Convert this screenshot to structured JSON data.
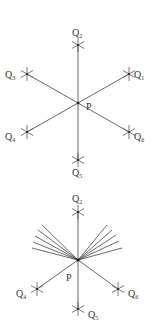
{
  "diagrams": [
    {
      "name": "six-direction-star",
      "center": {
        "label": "P",
        "x": 78,
        "y": 103,
        "label_x": 86,
        "label_y": 110
      },
      "points": [
        {
          "label": "Q",
          "sub": "1",
          "x": 129,
          "y": 74,
          "lx": 134,
          "ly": 78
        },
        {
          "label": "Q",
          "sub": "2",
          "x": 78,
          "y": 45,
          "lx": 72,
          "ly": 36
        },
        {
          "label": "Q",
          "sub": "3",
          "x": 27,
          "y": 74,
          "lx": 5,
          "ly": 78
        },
        {
          "label": "Q",
          "sub": "4",
          "x": 27,
          "y": 132,
          "lx": 5,
          "ly": 140
        },
        {
          "label": "Q",
          "sub": "5",
          "x": 78,
          "y": 160,
          "lx": 72,
          "ly": 176
        },
        {
          "label": "Q",
          "sub": "6",
          "x": 129,
          "y": 132,
          "lx": 134,
          "ly": 140
        }
      ]
    },
    {
      "name": "fan-diagram",
      "center": {
        "label": "P",
        "x": 78,
        "y": 260,
        "label_x": 66,
        "label_y": 281
      },
      "points": [
        {
          "label": "Q",
          "sub": "2",
          "x": 78,
          "y": 212,
          "lx": 72,
          "ly": 202
        },
        {
          "label": "Q",
          "sub": "4",
          "x": 37,
          "y": 289,
          "lx": 16,
          "ly": 297
        },
        {
          "label": "Q",
          "sub": "5",
          "x": 78,
          "y": 309,
          "lx": 88,
          "ly": 318
        },
        {
          "label": "Q",
          "sub": "6",
          "x": 118,
          "y": 289,
          "lx": 128,
          "ly": 297
        }
      ],
      "fan_left": [
        [
          42,
          225
        ],
        [
          38,
          230
        ],
        [
          35,
          236
        ],
        [
          33,
          242
        ],
        [
          32,
          248
        ]
      ],
      "fan_right": [
        [
          107,
          225
        ],
        [
          112,
          230
        ],
        [
          116,
          235
        ],
        [
          119,
          241
        ],
        [
          122,
          248
        ]
      ]
    }
  ]
}
